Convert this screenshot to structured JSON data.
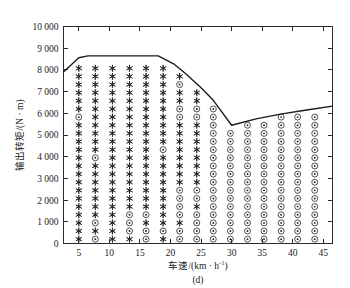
{
  "figure": {
    "caption": "(d)",
    "background_color": "#ffffff",
    "foreground_color": "#1a1a1a"
  },
  "chart_data": {
    "type": "scatter",
    "title": "",
    "subtitle": "",
    "caption": "(d)",
    "xlabel": "车速/(km · h",
    "xlabel_exponent": "-1",
    "xlabel_suffix": ")",
    "ylabel": "输出转矩/(N · m)",
    "xlim": [
      2.5,
      46.5
    ],
    "ylim": [
      0,
      10000
    ],
    "xticks": [
      5,
      10,
      15,
      20,
      25,
      30,
      35,
      40,
      45
    ],
    "xtick_labels": [
      "5",
      "10",
      "15",
      "20",
      "25",
      "30",
      "35",
      "40",
      "45"
    ],
    "yticks": [
      0,
      1000,
      2000,
      3000,
      4000,
      5000,
      6000,
      7000,
      8000,
      9000,
      10000
    ],
    "ytick_labels": [
      "0",
      "1 000",
      "2 000",
      "3 000",
      "4 000",
      "5 000",
      "6 000",
      "7 000",
      "8 000",
      "9 000",
      "10 000"
    ],
    "grid": false,
    "legend_position": "none",
    "series": [
      {
        "name": "envelope",
        "type": "line",
        "label": "最大输出转矩包络线",
        "color": "#1a1a1a",
        "x": [
          2.5,
          5.0,
          6.5,
          18.0,
          20.5,
          22.5,
          25.0,
          27.0,
          30.0,
          34.0,
          38.0,
          42.0,
          46.5
        ],
        "y": [
          7900,
          8560,
          8650,
          8650,
          8280,
          7820,
          7180,
          6600,
          5450,
          5740,
          5960,
          6140,
          6330
        ]
      },
      {
        "name": "star-points",
        "type": "scatter",
        "label": "工作点(星号)",
        "marker": "star",
        "color": "#242424",
        "description": "发动机与电机混合驱动工作点，分布于低车速区域"
      },
      {
        "name": "circle-points",
        "type": "scatter",
        "label": "工作点(圆圈)",
        "marker": "circle-dot",
        "color": "#242424",
        "description": "纯电驱动工作点，分布于高车速及低转矩区域"
      }
    ],
    "grid_x": [
      5.0,
      7.7,
      10.5,
      13.3,
      16.0,
      18.8,
      21.5,
      24.3,
      27.0,
      29.8,
      32.6,
      35.3,
      38.1,
      40.8,
      43.6
    ],
    "grid_y": [
      200,
      575,
      950,
      1325,
      1700,
      2075,
      2450,
      2825,
      3200,
      3575,
      3950,
      4325,
      4700,
      5075,
      5450,
      5825,
      6200,
      6575,
      6950,
      7325,
      7700,
      8075
    ],
    "marker_rule": {
      "star_region": "points below the envelope with speed roughly under 30 km/h; star dominates the upper-left block",
      "circle_region": "points at higher speed (>= ~27 km/h) and scattered low-torque points at low speed"
    }
  }
}
